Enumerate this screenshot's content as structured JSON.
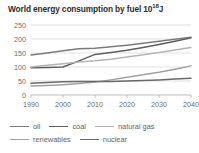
{
  "chart_data": {
    "type": "line",
    "title": "World energy consumption by fuel 10",
    "title_sup": "18",
    "title_suffix": "J",
    "xlabel": "",
    "ylabel": "",
    "xlim": [
      1990,
      2040
    ],
    "ylim": [
      0,
      250
    ],
    "grid": true,
    "legend_position": "bottom",
    "x_ticks": [
      "1990",
      "2000",
      "2010",
      "2020",
      "2030",
      "2040"
    ],
    "y_ticks": [
      "0",
      "50",
      "100",
      "150",
      "200",
      "250"
    ],
    "x": [
      1990,
      1995,
      2000,
      2005,
      2010,
      2015,
      2020,
      2025,
      2030,
      2035,
      2040
    ],
    "series": [
      {
        "name": "oil",
        "color": "#7a7a7a",
        "values": [
          143,
          150,
          158,
          165,
          167,
          172,
          178,
          185,
          192,
          199,
          206
        ]
      },
      {
        "name": "coal",
        "color": "#5e5e5e",
        "values": [
          97,
          98,
          100,
          122,
          145,
          152,
          160,
          170,
          180,
          192,
          204
        ]
      },
      {
        "name": "natural gas",
        "color": "#b4b4b4",
        "values": [
          100,
          106,
          112,
          118,
          122,
          128,
          136,
          144,
          152,
          161,
          170
        ]
      },
      {
        "name": "renewables",
        "color": "#a0a0a0",
        "values": [
          32,
          34,
          37,
          41,
          46,
          54,
          63,
          72,
          81,
          92,
          104
        ]
      },
      {
        "name": "nuclear",
        "color": "#6a6a6a",
        "values": [
          42,
          45,
          47,
          48,
          48,
          48,
          50,
          52,
          54,
          57,
          60
        ]
      }
    ]
  },
  "legend": {
    "rows": [
      [
        {
          "label": "oil",
          "color": "#7a7a7a"
        },
        {
          "label": "coal",
          "color": "#5e5e5e"
        },
        {
          "label": "natural gas",
          "color": "#b4b4b4"
        }
      ],
      [
        {
          "label": "renewables",
          "color": "#a0a0a0"
        },
        {
          "label": "nuclear",
          "color": "#6a6a6a"
        }
      ]
    ]
  }
}
